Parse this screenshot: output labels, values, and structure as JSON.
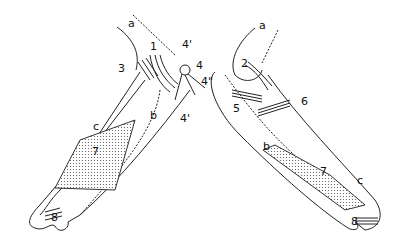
{
  "figure": {
    "type": "anatomical line drawing",
    "panels": [
      {
        "id": "left",
        "labels": [
          {
            "text": "a",
            "x": 128,
            "y": 24
          },
          {
            "text": "1",
            "x": 150,
            "y": 47
          },
          {
            "text": "3",
            "x": 120,
            "y": 67
          },
          {
            "text": "4'",
            "x": 182,
            "y": 44
          },
          {
            "text": "4",
            "x": 196,
            "y": 62
          },
          {
            "text": "4\"",
            "x": 203,
            "y": 79
          },
          {
            "text": "b",
            "x": 150,
            "y": 115
          },
          {
            "text": "4'",
            "x": 180,
            "y": 119
          },
          {
            "text": "c",
            "x": 93,
            "y": 126
          },
          {
            "text": "7",
            "x": 92,
            "y": 150
          },
          {
            "text": "8",
            "x": 51,
            "y": 216
          }
        ]
      },
      {
        "id": "right",
        "labels": [
          {
            "text": "a",
            "x": 259,
            "y": 25
          },
          {
            "text": "2",
            "x": 241,
            "y": 57
          },
          {
            "text": "5",
            "x": 233,
            "y": 99
          },
          {
            "text": "6",
            "x": 301,
            "y": 95
          },
          {
            "text": "b",
            "x": 263,
            "y": 139
          },
          {
            "text": "7",
            "x": 320,
            "y": 160
          },
          {
            "text": "c",
            "x": 357,
            "y": 174
          },
          {
            "text": "8",
            "x": 349,
            "y": 220
          }
        ]
      }
    ]
  }
}
